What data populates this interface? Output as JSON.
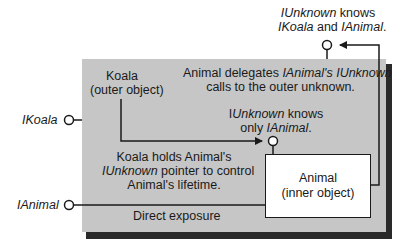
{
  "diagram": {
    "outer_object": {
      "name": "Koala",
      "subtitle": "(outer object)"
    },
    "inner_object": {
      "name": "Animal",
      "subtitle": "(inner object)"
    },
    "interfaces": {
      "ikoala": "IKoala",
      "ianimal": "IAnimal"
    },
    "annotations": {
      "outer_unknown": {
        "line1_i": "IUnknown",
        "line1_rest": " knows",
        "line2_i1": "IKoala",
        "line2_mid": " and ",
        "line2_i2": "IAnimal",
        "line2_end": "."
      },
      "delegation": {
        "line1_pre": "Animal delegates ",
        "line1_i": "IAnimal's IUnknown",
        "line2": "calls to the outer unknown."
      },
      "inner_unknown": {
        "line1_pre": "I",
        "line1_i": "Unknown",
        "line1_rest": " knows",
        "line2_pre": "only ",
        "line2_i": "IAnimal",
        "line2_end": "."
      },
      "holds_pointer": {
        "line1": "Koala holds Animal's",
        "line2_i": "IUnknown",
        "line2_rest": " pointer to control",
        "line3": "Animal's lifetime."
      },
      "direct_exposure": "Direct exposure"
    },
    "colors": {
      "outer_fill": "#c6c6c6",
      "shadow": "#2a2a2a",
      "inner_fill": "#ffffff",
      "line": "#1a1a1a"
    }
  }
}
